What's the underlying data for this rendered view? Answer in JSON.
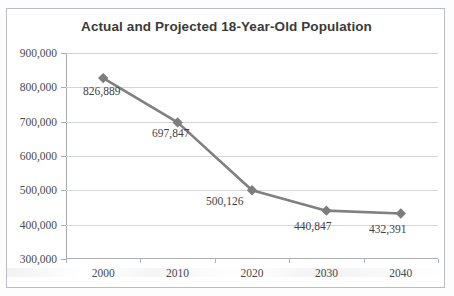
{
  "chart_data": {
    "type": "line",
    "title": "Actual and Projected 18-Year-Old Population",
    "xlabel": "",
    "ylabel": "",
    "categories": [
      "2000",
      "2010",
      "2020",
      "2030",
      "2040"
    ],
    "values": [
      826889,
      697847,
      500126,
      440847,
      432391
    ],
    "point_labels": [
      "826,889",
      "697,847",
      "500,126",
      "440,847",
      "432,391"
    ],
    "ylim": [
      300000,
      900000
    ],
    "y_ticks": [
      300000,
      400000,
      500000,
      600000,
      700000,
      800000,
      900000
    ],
    "y_tick_labels": [
      "300,000",
      "400,000",
      "500,000",
      "600,000",
      "700,000",
      "800,000",
      "900,000"
    ],
    "x_tick_labels": [
      "2000",
      "2010",
      "2020",
      "2030",
      "2040"
    ],
    "grid": true,
    "legend": false,
    "legend_position": "none",
    "series": [
      {
        "name": "18-Year-Old Population",
        "values": [
          826889,
          697847,
          500126,
          440847,
          432391
        ],
        "line_color": "#808080",
        "marker": "diamond",
        "marker_color": "#808080"
      }
    ],
    "colors": {
      "line": "#808080",
      "marker": "#7d7d7d",
      "gridline": "#d3d5d7",
      "axis": "#a8abae",
      "title_text": "#3a3a3a",
      "tick_text": "#4a4a4a",
      "label_text": "#3f3f3f",
      "frame_border": "#b9bcc0",
      "plot_background": "#ffffff"
    }
  }
}
